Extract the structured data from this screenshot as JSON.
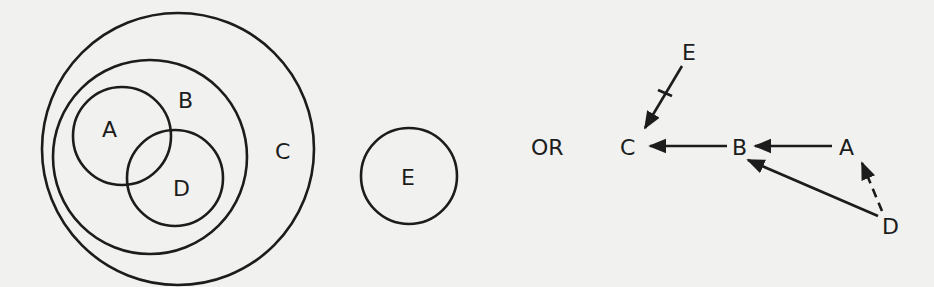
{
  "figure": {
    "venn": {
      "labels": {
        "A": "A",
        "B": "B",
        "C": "C",
        "D": "D"
      },
      "description": "A and D overlap, both inside B; B inside C"
    },
    "separate_set": {
      "label": "E"
    },
    "connector": {
      "label": "OR"
    },
    "graph": {
      "nodes": {
        "E": "E",
        "C": "C",
        "B": "B",
        "A": "A",
        "D": "D"
      },
      "edges": [
        {
          "from": "E",
          "to": "C",
          "style": "solid",
          "crossed": true
        },
        {
          "from": "B",
          "to": "C",
          "style": "solid",
          "crossed": false
        },
        {
          "from": "A",
          "to": "B",
          "style": "solid",
          "crossed": false
        },
        {
          "from": "D",
          "to": "B",
          "style": "solid",
          "crossed": false
        },
        {
          "from": "D",
          "to": "A",
          "style": "dashed",
          "crossed": false
        }
      ]
    },
    "colors": {
      "ink": "#1c1c1c",
      "paper": "#f1f1ef"
    }
  }
}
